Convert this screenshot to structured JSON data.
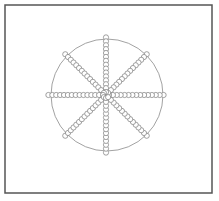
{
  "diagram": {
    "frame": {
      "x": 5,
      "y": 5,
      "width": 207,
      "height": 188,
      "stroke": "#555555",
      "stroke_width": 1.5
    },
    "outer_circle": {
      "cx": 107,
      "cy": 95,
      "r": 56,
      "stroke": "#8a8a8a",
      "stroke_width": 0.8
    },
    "spokes": {
      "center": {
        "cx": 106,
        "cy": 95
      },
      "count": 8,
      "angles_deg": [
        0,
        45,
        90,
        135,
        180,
        225,
        270,
        315
      ],
      "bead_radius": 2.6,
      "bead_spacing": 3.9,
      "beads_per_spoke": 15,
      "start_offset": 3,
      "bead_stroke": "#7a7a7a",
      "bead_fill": "#ffffff"
    }
  }
}
